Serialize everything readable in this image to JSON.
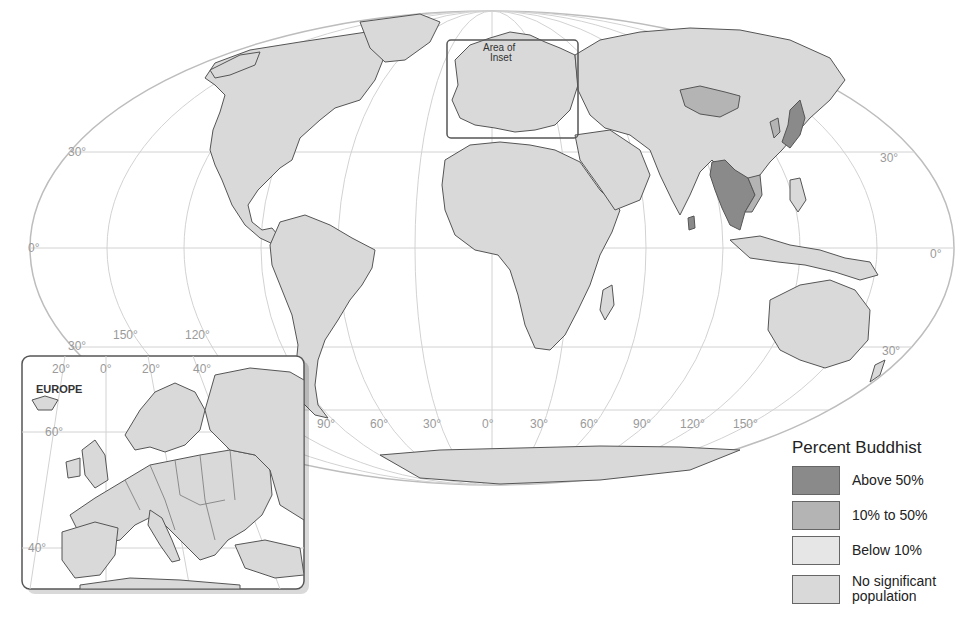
{
  "map": {
    "title": "Percent Buddhist",
    "projection": "world (Mollweide-style oval)",
    "latitude_labels": {
      "north_30_left": "30°",
      "equator_left": "0°",
      "south_30_left": "30°",
      "north_30_right": "30°",
      "equator_right": "0°",
      "south_30_right": "30°"
    },
    "longitude_labels_top": [
      "150°",
      "120°"
    ],
    "longitude_labels_bottom": [
      "90°",
      "60°",
      "30°",
      "0°",
      "30°",
      "60°",
      "90°",
      "120°",
      "150°"
    ],
    "inset_marker_label": "Area of Inset",
    "inset_marker_label_line1": "Area of",
    "inset_marker_label_line2": "Inset",
    "inset": {
      "title": "EUROPE",
      "longitude_labels": [
        "20°",
        "0°",
        "20°",
        "40°"
      ],
      "latitude_labels": [
        "60°",
        "40°"
      ]
    }
  },
  "legend": {
    "title": "Percent Buddhist",
    "items": [
      {
        "label": "Above 50%",
        "color": "#8a8a8a"
      },
      {
        "label": "10% to 50%",
        "color": "#b4b4b4"
      },
      {
        "label": "Below 10%",
        "color": "#e6e6e6"
      },
      {
        "label": "No significant population",
        "label_line1": "No significant",
        "label_line2": "population",
        "color": "#d9d9d9"
      }
    ]
  },
  "categories": {
    "above_50": [
      "Myanmar",
      "Thailand",
      "Laos",
      "Cambodia",
      "Sri Lanka",
      "Japan",
      "Bhutan"
    ],
    "10_to_50": [
      "Mongolia",
      "Vietnam",
      "South Korea"
    ],
    "colors": {
      "above_50": "#8a8a8a",
      "10_to_50": "#b4b4b4",
      "below_10": "#e6e6e6",
      "none": "#d9d9d9",
      "border": "#555555",
      "graticule": "#c8c8c8",
      "ocean": "#ffffff"
    }
  }
}
